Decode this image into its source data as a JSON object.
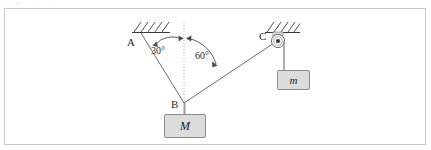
{
  "figure": {
    "type": "physics-free-body-diagram",
    "top_artifact_text": "· — ·  ·",
    "frame_color": "#c9c9c9",
    "background_color": "#ffffff"
  },
  "points": {
    "A": {
      "label": "A",
      "x": 140,
      "y": 32,
      "kind": "ceiling-anchor"
    },
    "B": {
      "label": "B",
      "x": 184,
      "y": 103,
      "kind": "rope-junction"
    },
    "C": {
      "label": "C",
      "x": 277,
      "y": 39,
      "kind": "pulley-anchor"
    }
  },
  "angles": [
    {
      "name": "angle-at-A-side",
      "label": "30°",
      "value": 30,
      "unit": "degrees",
      "from": "vertical-dotted-line",
      "to": "rope-BA"
    },
    {
      "name": "angle-at-C-side",
      "label": "60°",
      "value": 60,
      "unit": "degrees",
      "from": "vertical-dotted-line",
      "to": "rope-BC"
    }
  ],
  "blocks": [
    {
      "name": "block-M",
      "label": "M",
      "hangs_from": "B",
      "fill": "#dcdcdc",
      "stroke": "#8c8c8c"
    },
    {
      "name": "block-m",
      "label": "m",
      "hangs_from": "pulley-C",
      "fill": "#dcdcdc",
      "stroke": "#8c8c8c"
    }
  ],
  "elements": {
    "hatching_A": "ceiling-hatch-A",
    "hatching_C": "ceiling-hatch-C",
    "pulley": "pulley-icon",
    "vertical_reference": "dotted-vertical-line",
    "rope_AB": "rope-segment",
    "rope_BC": "rope-segment",
    "rope_M": "rope-segment",
    "rope_m": "rope-segment"
  },
  "colors": {
    "line": "#4a4a4a",
    "rope": "#6e6e6e",
    "dotted": "#b0b0b0",
    "hatch": "#3a3a3a",
    "text": "#2b2b2b"
  }
}
